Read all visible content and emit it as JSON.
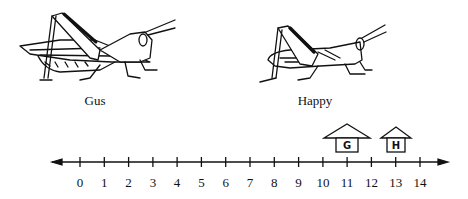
{
  "figure": {
    "characters": [
      {
        "name": "Gus",
        "house_letter": "G",
        "house_position": 11
      },
      {
        "name": "Happy",
        "house_letter": "H",
        "house_position": 13
      }
    ],
    "number_line": {
      "min": 0,
      "max": 14,
      "ticks": [
        "0",
        "1",
        "2",
        "3",
        "4",
        "5",
        "6",
        "7",
        "8",
        "9",
        "10",
        "11",
        "12",
        "13",
        "14"
      ],
      "arrows": "both"
    }
  }
}
